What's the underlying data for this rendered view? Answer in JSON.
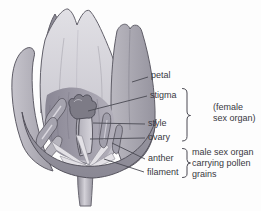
{
  "diagram": {
    "labels": [
      {
        "text": "petal"
      },
      {
        "text": "stigma"
      },
      {
        "text": "style"
      },
      {
        "text": "ovary"
      },
      {
        "text": "anther"
      },
      {
        "text": "filament"
      }
    ],
    "female_group": {
      "line1": "(female",
      "line2": "sex organ)"
    },
    "male_group": {
      "line1": "male sex organ",
      "line2": "carrying pollen",
      "line3": "grains"
    },
    "colors": {
      "background": "#fdfdfd",
      "text": "#39383f",
      "leader_line": "#4a4952",
      "petal_light": "#d0cfd6",
      "petal_medium": "#a5a3ad",
      "petal_dark": "#8e8c97",
      "stigma": "#7d7b86",
      "filament_strand": "#e3e1e6"
    }
  }
}
